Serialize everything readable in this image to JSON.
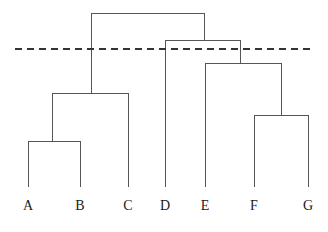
{
  "figure": {
    "type": "dendrogram",
    "background_color": "#ffffff",
    "line_color": "#555555",
    "line_width": 1,
    "label_color": "#1a1a1a"
  },
  "chart_data": {
    "type": "line",
    "title": "",
    "xlabel": "",
    "ylabel": "",
    "grid": false,
    "legend": null,
    "plot_kind": "dendrogram",
    "orientation": "vertical",
    "leaf_labels": [
      "A",
      "B",
      "C",
      "D",
      "E",
      "F",
      "G"
    ],
    "leaf_positions_px": [
      28,
      80,
      128,
      165,
      205,
      254,
      308
    ],
    "leaf_baseline_y_px": 187,
    "label_baseline_y_px": 210,
    "merges": [
      {
        "id": "m1",
        "label": "A+B",
        "children": [
          "A",
          "B"
        ],
        "left_x_px": 28,
        "right_x_px": 80,
        "center_x_px": 52,
        "height_y_px": 141
      },
      {
        "id": "m2",
        "label": "(A,B)+C",
        "children": [
          "m1",
          "C"
        ],
        "left_x_px": 52,
        "right_x_px": 128,
        "center_x_px": 91,
        "height_y_px": 93
      },
      {
        "id": "m3",
        "label": "F+G",
        "children": [
          "F",
          "G"
        ],
        "left_x_px": 254,
        "right_x_px": 308,
        "center_x_px": 281,
        "height_y_px": 115
      },
      {
        "id": "m4",
        "label": "E+(F,G)",
        "children": [
          "E",
          "m3"
        ],
        "left_x_px": 205,
        "right_x_px": 281,
        "center_x_px": 240,
        "height_y_px": 63
      },
      {
        "id": "m5",
        "label": "D+(E,F,G)",
        "children": [
          "D",
          "m4"
        ],
        "left_x_px": 165,
        "right_x_px": 240,
        "center_x_px": 204,
        "height_y_px": 40
      },
      {
        "id": "m6",
        "label": "root",
        "children": [
          "m2",
          "m5"
        ],
        "left_x_px": 91,
        "right_x_px": 204,
        "center_x_px": 148,
        "height_y_px": 13
      }
    ],
    "threshold_line": {
      "label": "cut threshold",
      "y_px": 48,
      "x_start_px": 15,
      "x_end_px": 314,
      "style": "dashed",
      "dash_length_px": 7,
      "dash_gap_px": 5,
      "color": "#333333",
      "width": 2
    },
    "clusters_below_threshold": [
      {
        "name": "cluster-1",
        "members": [
          "A",
          "B",
          "C"
        ]
      },
      {
        "name": "cluster-2",
        "members": [
          "D"
        ]
      },
      {
        "name": "cluster-3",
        "members": [
          "E",
          "F",
          "G"
        ]
      }
    ]
  }
}
